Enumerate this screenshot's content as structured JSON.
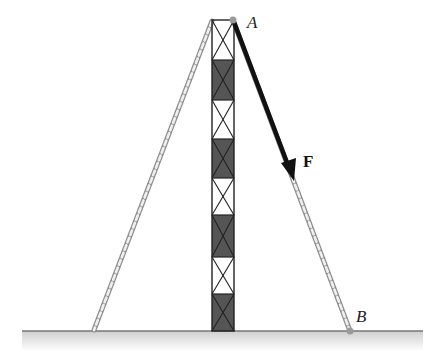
{
  "diagram": {
    "type": "statics-figure",
    "labels": {
      "point_a": "A",
      "point_b": "B",
      "force": "F"
    },
    "points": {
      "A": [
        233,
        20
      ],
      "B": [
        350,
        331
      ],
      "tower_top_left": [
        212,
        21
      ],
      "left_anchor": [
        94,
        330
      ],
      "force_tip": [
        294,
        180
      ]
    },
    "tower": {
      "x_left": 212,
      "x_right": 234,
      "top": 20,
      "bottom": 331,
      "segments": [
        {
          "top": 20,
          "bottom": 60,
          "fill": "white"
        },
        {
          "top": 60,
          "bottom": 100,
          "fill": "dark"
        },
        {
          "top": 100,
          "bottom": 139,
          "fill": "white"
        },
        {
          "top": 139,
          "bottom": 178,
          "fill": "dark"
        },
        {
          "top": 178,
          "bottom": 215,
          "fill": "white"
        },
        {
          "top": 215,
          "bottom": 257,
          "fill": "dark"
        },
        {
          "top": 257,
          "bottom": 294,
          "fill": "white"
        },
        {
          "top": 294,
          "bottom": 331,
          "fill": "dark"
        }
      ]
    },
    "ground": {
      "x1": 22,
      "x2": 423,
      "y": 331
    },
    "colors": {
      "tower_dark": "#555555",
      "tower_line": "#222222",
      "rope": "#9a9a9a",
      "arrow": "#111111",
      "ground_line": "#777777",
      "ground_shade": "#d8d8d8"
    }
  }
}
